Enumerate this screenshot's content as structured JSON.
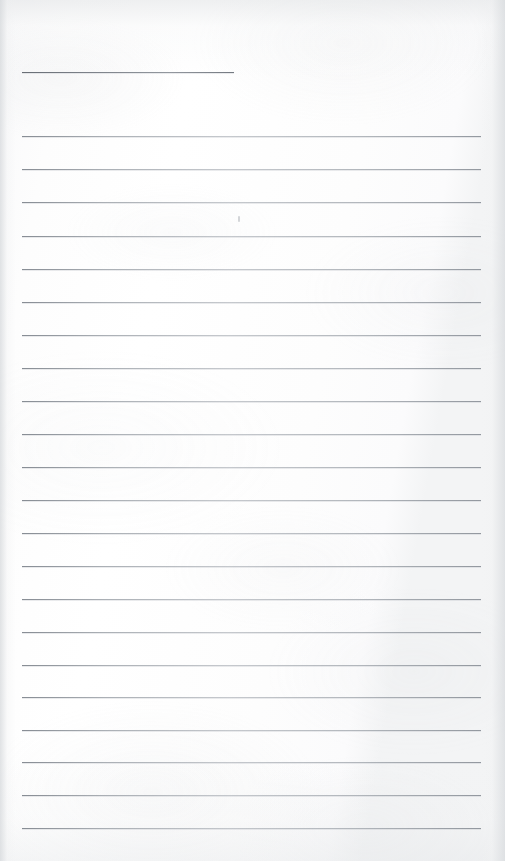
{
  "page": {
    "kind": "scanned-lined-notebook-page",
    "width_px": 505,
    "height_px": 861,
    "background_color": "#fcfcfc",
    "paper_tone_color": "#fdfdfd",
    "edge_shade_color": "#d6d9dc",
    "content_text": "",
    "note": ""
  },
  "rules": {
    "line_color": "#a8adb4",
    "header_line_color": "#6a7078",
    "left_x": 22,
    "right_x": 481,
    "line_spacing_px": 33,
    "total_count": 24,
    "header_rule": {
      "label": "",
      "x": 22,
      "y": 72,
      "width": 212
    },
    "body_rules": [
      {
        "y": 136,
        "x": 22,
        "width": 459
      },
      {
        "y": 169,
        "x": 22,
        "width": 459
      },
      {
        "y": 202,
        "x": 22,
        "width": 459
      },
      {
        "y": 236,
        "x": 22,
        "width": 459
      },
      {
        "y": 269,
        "x": 22,
        "width": 459
      },
      {
        "y": 302,
        "x": 22,
        "width": 459
      },
      {
        "y": 335,
        "x": 22,
        "width": 459
      },
      {
        "y": 368,
        "x": 22,
        "width": 459
      },
      {
        "y": 401,
        "x": 22,
        "width": 459
      },
      {
        "y": 434,
        "x": 22,
        "width": 459
      },
      {
        "y": 467,
        "x": 22,
        "width": 459
      },
      {
        "y": 500,
        "x": 22,
        "width": 459
      },
      {
        "y": 533,
        "x": 22,
        "width": 459
      },
      {
        "y": 566,
        "x": 22,
        "width": 459
      },
      {
        "y": 599,
        "x": 22,
        "width": 459
      },
      {
        "y": 632,
        "x": 22,
        "width": 459
      },
      {
        "y": 665,
        "x": 22,
        "width": 459
      },
      {
        "y": 697,
        "x": 22,
        "width": 459
      },
      {
        "y": 730,
        "x": 22,
        "width": 459
      },
      {
        "y": 762,
        "x": 22,
        "width": 459
      },
      {
        "y": 795,
        "x": 22,
        "width": 459
      },
      {
        "y": 828,
        "x": 22,
        "width": 459
      }
    ]
  },
  "artifacts": {
    "specks": [
      {
        "x": 238,
        "y": 216,
        "w": 2,
        "h": 6
      }
    ]
  }
}
